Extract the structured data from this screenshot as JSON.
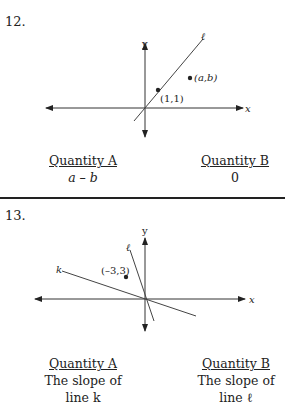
{
  "problems": [
    {
      "number": "12.",
      "diagram": {
        "y_label": "y",
        "x_label": "x",
        "line_label": "ℓ",
        "point1_label": "(1,1)",
        "point2_label": "(a,b)"
      },
      "quantity_a": {
        "heading": "Quantity A",
        "value": "a – b"
      },
      "quantity_b": {
        "heading": "Quantity B",
        "value": "0"
      }
    },
    {
      "number": "13.",
      "diagram": {
        "y_label": "y",
        "x_label": "x",
        "line_k_label": "k",
        "line_l_label": "ℓ",
        "point_label": "(–3,3)"
      },
      "quantity_a": {
        "heading": "Quantity A",
        "line1": "The slope of",
        "line2": "line k"
      },
      "quantity_b": {
        "heading": "Quantity B",
        "line1": "The slope of",
        "line2": "line ℓ"
      }
    }
  ]
}
